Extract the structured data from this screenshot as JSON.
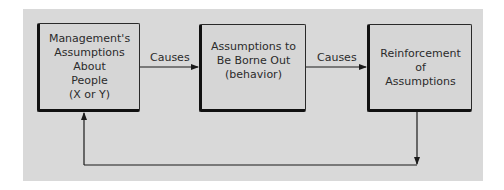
{
  "diagram": {
    "title": "",
    "nodes": [
      {
        "id": "n1",
        "label": "Management's\nAssumptions\nAbout\nPeople\n(X or Y)"
      },
      {
        "id": "n2",
        "label": "Assumptions to\nBe Borne Out\n(behavior)"
      },
      {
        "id": "n3",
        "label": "Reinforcement\nof\nAssumptions"
      }
    ],
    "edges": [
      {
        "from": "n1",
        "to": "n2",
        "label": "Causes"
      },
      {
        "from": "n2",
        "to": "n3",
        "label": "Causes"
      },
      {
        "from": "n3",
        "to": "n1",
        "label": ""
      }
    ]
  },
  "colors": {
    "panel_bg": "#d9d9d9",
    "box_bg": "#d6d6d6",
    "line": "#1a1a1a",
    "text": "#2b2b2b"
  }
}
